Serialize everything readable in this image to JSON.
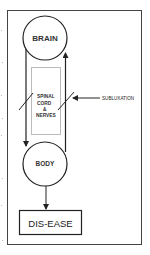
{
  "diagram": {
    "title": "",
    "nodes": {
      "brain": {
        "label": "BRAIN",
        "shape": "circle"
      },
      "spinal": {
        "lines": [
          "SPINAL",
          "CORD",
          "&",
          "NERVES"
        ],
        "shape": "rectangle"
      },
      "body": {
        "label": "BODY",
        "shape": "circle"
      },
      "disease": {
        "label": "DIS-EASE",
        "shape": "rectangle"
      }
    },
    "annotations": {
      "subluxation": {
        "label": "SUBLUXATION"
      }
    },
    "edges": [
      {
        "from": "brain",
        "to": "body",
        "via": "left-line",
        "direction": "down"
      },
      {
        "from": "body",
        "to": "brain",
        "via": "right-line",
        "direction": "up"
      },
      {
        "from": "body",
        "to": "disease",
        "direction": "down"
      }
    ],
    "colors": {
      "stroke": "#333333",
      "frame": "#444444",
      "spinal_box_stroke": "#bbbbbb",
      "text": "#333333",
      "background": "#ffffff"
    }
  }
}
